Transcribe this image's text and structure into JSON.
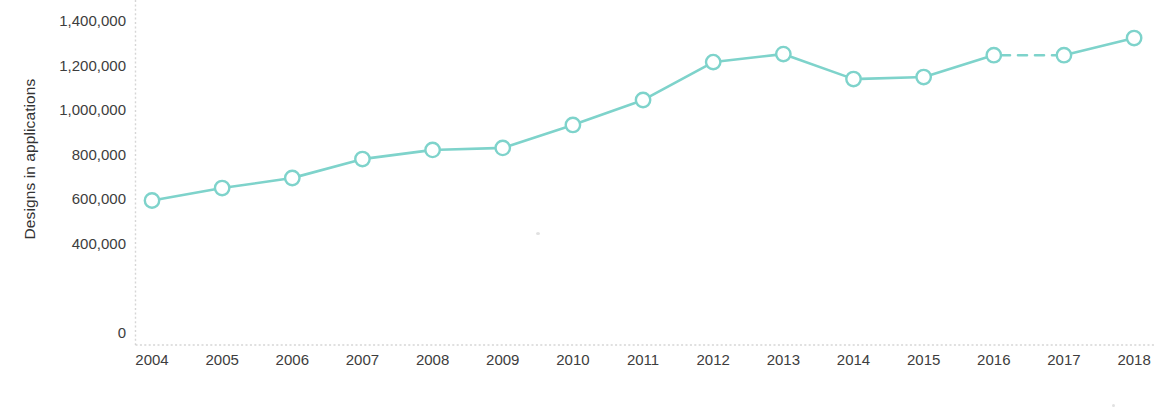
{
  "chart_data": {
    "type": "line",
    "title": "",
    "xlabel": "Application year",
    "ylabel": "Designs in applications",
    "categories": [
      "2004",
      "2005",
      "2006",
      "2007",
      "2008",
      "2009",
      "2010",
      "2011",
      "2012",
      "2013",
      "2014",
      "2015",
      "2016",
      "2017",
      "2018"
    ],
    "values": [
      590000,
      646000,
      691000,
      776000,
      817000,
      826000,
      929000,
      1041000,
      1211000,
      1247000,
      1135000,
      1144000,
      1242000,
      1242000,
      1319000
    ],
    "series": [
      {
        "name": "Designs in applications",
        "values": [
          590000,
          646000,
          691000,
          776000,
          817000,
          826000,
          929000,
          1041000,
          1211000,
          1247000,
          1135000,
          1144000,
          1242000,
          1242000,
          1319000
        ]
      }
    ],
    "ylim": [
      0,
      1400000
    ],
    "ytick_labels": [
      "1,400,000",
      "1,200,000",
      "1,000,000",
      "800,000",
      "600,000",
      "400,000",
      "0"
    ],
    "ytick_values": [
      1400000,
      1200000,
      1000000,
      800000,
      600000,
      400000,
      0
    ],
    "xtick_labels": [
      "2004",
      "2005",
      "2006",
      "2007",
      "2008",
      "2009",
      "2010",
      "2011",
      "2012",
      "2013",
      "2014",
      "2015",
      "2016",
      "2017",
      "2018"
    ],
    "grid": false,
    "legend": "none",
    "line_color": "#7ed3cb",
    "marker_style": "open-circle",
    "marker_fill": "#ffffff",
    "dashed_segments": [
      {
        "from": "2016",
        "to": "2017"
      }
    ],
    "axis_color": "#cfcfcf",
    "annotations": []
  },
  "axis": {
    "y_title": "Designs in applications",
    "x_title": "Application year"
  }
}
